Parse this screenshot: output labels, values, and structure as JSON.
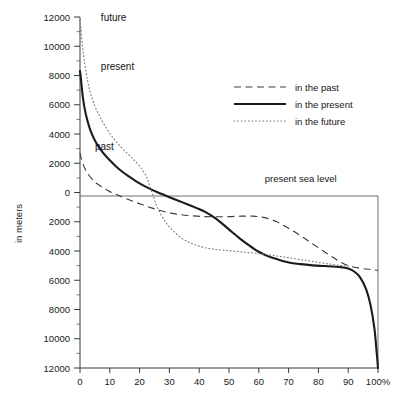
{
  "chart_data": {
    "type": "line",
    "title": "",
    "subtitle": "",
    "xlabel": "",
    "ylabel": "in meters",
    "xlim": [
      0,
      100
    ],
    "ylim": [
      -12000,
      12000
    ],
    "grid": false,
    "legend_position": "upper-right",
    "x_tick_labels": [
      "0",
      "10",
      "20",
      "30",
      "40",
      "50",
      "60",
      "70",
      "80",
      "90",
      "100%"
    ],
    "x_ticks": [
      0,
      10,
      20,
      30,
      40,
      50,
      60,
      70,
      80,
      90,
      100
    ],
    "y_ticks": [
      12000,
      10000,
      8000,
      6000,
      4000,
      2000,
      0,
      -2000,
      -4000,
      -6000,
      -8000,
      -10000,
      -12000
    ],
    "y_tick_labels": [
      "12000",
      "10000",
      "8000",
      "6000",
      "4000",
      "2000",
      "0",
      "2000",
      "4000",
      "6000",
      "8000",
      "10000",
      "12000"
    ],
    "y_minor_step": 1000,
    "annotations": [
      {
        "text": "future",
        "x": 7,
        "y": 11700
      },
      {
        "text": "present",
        "x": 7,
        "y": 8350
      },
      {
        "text": "past",
        "x": 5,
        "y": 2900
      },
      {
        "text": "present sea level",
        "x": 62,
        "y": 700
      }
    ],
    "reference_line": {
      "label": "present sea level",
      "y": 0
    },
    "series": [
      {
        "name": "in the past",
        "label": "in the past",
        "style": "dashed",
        "color": "#3c3c3c",
        "x": [
          0,
          0.4,
          1,
          2,
          3,
          4.5,
          6,
          8,
          10,
          12,
          15,
          18,
          21,
          24,
          27,
          30,
          34,
          38,
          42,
          46,
          50,
          54,
          58,
          62,
          66,
          70,
          74,
          78,
          82,
          86,
          90,
          94,
          97,
          99,
          100
        ],
        "y": [
          2700,
          2350,
          1950,
          1500,
          1180,
          820,
          560,
          280,
          60,
          -120,
          -380,
          -620,
          -840,
          -1050,
          -1230,
          -1380,
          -1520,
          -1600,
          -1650,
          -1660,
          -1650,
          -1620,
          -1620,
          -1720,
          -2000,
          -2450,
          -2950,
          -3500,
          -4050,
          -4580,
          -5000,
          -5180,
          -5250,
          -5300,
          -5320
        ]
      },
      {
        "name": "in the present",
        "label": "in the present",
        "style": "solid",
        "color": "#1b1b1b",
        "x": [
          0,
          0.3,
          0.8,
          1.5,
          2.5,
          3.5,
          5,
          6.5,
          8,
          10,
          12,
          14,
          16,
          18,
          20,
          22,
          24,
          26,
          28,
          30,
          33,
          36,
          39,
          42,
          45,
          48,
          51,
          54,
          57,
          60,
          63,
          66,
          70,
          74,
          78,
          82,
          86,
          88,
          90,
          92,
          94,
          96,
          97.5,
          98.8,
          99.5,
          100
        ],
        "y": [
          8300,
          7800,
          6800,
          5800,
          4900,
          4250,
          3550,
          3050,
          2650,
          2200,
          1800,
          1450,
          1150,
          880,
          620,
          400,
          200,
          20,
          -150,
          -320,
          -560,
          -800,
          -1050,
          -1320,
          -1700,
          -2180,
          -2700,
          -3200,
          -3650,
          -4050,
          -4350,
          -4550,
          -4780,
          -4900,
          -4980,
          -5030,
          -5080,
          -5120,
          -5200,
          -5400,
          -5800,
          -6600,
          -7700,
          -9300,
          -10800,
          -12000
        ]
      },
      {
        "name": "in the future",
        "label": "in the future",
        "style": "dotted",
        "color": "#7d7d7d",
        "x": [
          0,
          0.3,
          0.8,
          1.5,
          2.5,
          3.5,
          5,
          6.5,
          8,
          10,
          12,
          14,
          16,
          18,
          20,
          22,
          23,
          24,
          25,
          26,
          28,
          30,
          33,
          36,
          39,
          42,
          45,
          48,
          52,
          56,
          60,
          64,
          68,
          72,
          76,
          80,
          84,
          87,
          90
        ],
        "y": [
          11800,
          11200,
          10100,
          8900,
          7700,
          6800,
          5900,
          5250,
          4700,
          4050,
          3500,
          3050,
          2650,
          2250,
          1800,
          1200,
          700,
          100,
          -500,
          -1050,
          -1800,
          -2350,
          -2950,
          -3350,
          -3600,
          -3780,
          -3880,
          -3940,
          -4020,
          -4100,
          -4180,
          -4280,
          -4400,
          -4520,
          -4650,
          -4780,
          -4900,
          -4980,
          -5050
        ]
      }
    ]
  }
}
